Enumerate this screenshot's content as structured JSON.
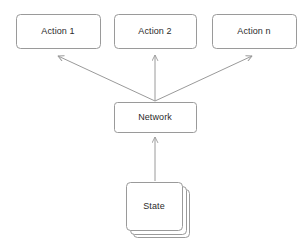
{
  "diagram": {
    "background_color": "#ffffff",
    "stroke_color": "#9a9a9a",
    "text_color": "#2b2b2b",
    "nodes": {
      "action_1": {
        "label": "Action 1",
        "shape": "rounded-rectangle"
      },
      "action_2": {
        "label": "Action 2",
        "shape": "rounded-rectangle"
      },
      "action_n": {
        "label": "Action n",
        "shape": "rounded-rectangle"
      },
      "network": {
        "label": "Network",
        "shape": "rounded-rectangle"
      },
      "state": {
        "label": "State",
        "shape": "stacked-rounded-rectangle",
        "stack_count": 3
      }
    },
    "edges": [
      {
        "from": "state",
        "to": "network",
        "arrow": "single",
        "direction": "up"
      },
      {
        "from": "network",
        "to": "action_1",
        "arrow": "single",
        "direction": "up-left"
      },
      {
        "from": "network",
        "to": "action_2",
        "arrow": "single",
        "direction": "up"
      },
      {
        "from": "network",
        "to": "action_n",
        "arrow": "single",
        "direction": "up-right"
      }
    ]
  }
}
